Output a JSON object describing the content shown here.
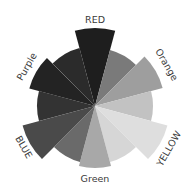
{
  "chart_data": {
    "type": "polar-area",
    "title": "",
    "center": [
      95,
      106
    ],
    "categories": [
      "RED",
      "Orange",
      "YELLOW",
      "Green",
      "BLUE",
      "Purple"
    ],
    "category_label_angles_deg": [
      0,
      60,
      120,
      180,
      240,
      300
    ],
    "wedges": [
      {
        "start": -15,
        "end": 15,
        "radius": 78,
        "color": "#1e1e1e",
        "group": "RED"
      },
      {
        "start": 15,
        "end": 45,
        "radius": 58,
        "color": "#7a7a7a",
        "group": "RED"
      },
      {
        "start": 45,
        "end": 75,
        "radius": 70,
        "color": "#9e9e9e",
        "group": "Orange"
      },
      {
        "start": 75,
        "end": 105,
        "radius": 58,
        "color": "#c2c2c2",
        "group": "Orange"
      },
      {
        "start": 105,
        "end": 135,
        "radius": 75,
        "color": "#dedede",
        "group": "YELLOW"
      },
      {
        "start": 135,
        "end": 165,
        "radius": 58,
        "color": "#d6d6d6",
        "group": "YELLOW"
      },
      {
        "start": 165,
        "end": 195,
        "radius": 62,
        "color": "#a8a8a8",
        "group": "Green"
      },
      {
        "start": 195,
        "end": 225,
        "radius": 58,
        "color": "#6a6a6a",
        "group": "Green"
      },
      {
        "start": 225,
        "end": 255,
        "radius": 75,
        "color": "#4a4a4a",
        "group": "BLUE"
      },
      {
        "start": 255,
        "end": 285,
        "radius": 58,
        "color": "#333333",
        "group": "BLUE"
      },
      {
        "start": 285,
        "end": 315,
        "radius": 68,
        "color": "#232323",
        "group": "Purple"
      },
      {
        "start": 315,
        "end": 345,
        "radius": 60,
        "color": "#2b2b2b",
        "group": "Purple"
      }
    ],
    "labels": [
      {
        "text": "RED",
        "angle": 0,
        "r": 86
      },
      {
        "text": "Orange",
        "angle": 60,
        "r": 82
      },
      {
        "text": "YELLOW",
        "angle": 120,
        "r": 86
      },
      {
        "text": "Green",
        "angle": 180,
        "r": 73
      },
      {
        "text": "BLUE",
        "angle": 240,
        "r": 83
      },
      {
        "text": "Purple",
        "angle": 300,
        "r": 78
      }
    ],
    "xlabel": "",
    "ylabel": "",
    "legend": "none",
    "grid": false
  }
}
